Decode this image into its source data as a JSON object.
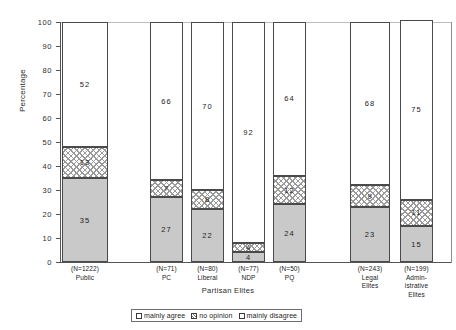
{
  "chart_data": {
    "type": "bar",
    "title": "",
    "xlabel": "Partisan Elites",
    "ylabel": "Percentage",
    "ylim": [
      0,
      100
    ],
    "yticks": [
      0,
      10,
      20,
      30,
      40,
      50,
      60,
      70,
      80,
      90,
      100
    ],
    "grid": false,
    "stacked": true,
    "legend_position": "bottom",
    "categories": [
      "Public",
      "PC",
      "Liberal",
      "NDP",
      "PQ",
      "Legal Elites",
      "Administrative Elites"
    ],
    "category_labels": [
      {
        "n": "(N=1222)",
        "name_line1": "Public",
        "name_line2": "",
        "name_line3": ""
      },
      {
        "n": "(N=71)",
        "name_line1": "PC",
        "name_line2": "",
        "name_line3": ""
      },
      {
        "n": "(N=80)",
        "name_line1": "Liberal",
        "name_line2": "",
        "name_line3": ""
      },
      {
        "n": "(N=77)",
        "name_line1": "NDP",
        "name_line2": "",
        "name_line3": ""
      },
      {
        "n": "(N=50)",
        "name_line1": "PQ",
        "name_line2": "",
        "name_line3": ""
      },
      {
        "n": "(N=243)",
        "name_line1": "Legal",
        "name_line2": "Elites",
        "name_line3": ""
      },
      {
        "n": "(N=199)",
        "name_line1": "Admin-",
        "name_line2": "istrative",
        "name_line3": "Elites"
      }
    ],
    "series": [
      {
        "name": "mainly agree",
        "values": [
          35,
          27,
          22,
          4,
          24,
          23,
          15
        ]
      },
      {
        "name": "no opinion",
        "values": [
          13,
          7,
          8,
          4,
          12,
          9,
          11
        ]
      },
      {
        "name": "mainly disagree",
        "values": [
          52,
          66,
          70,
          92,
          64,
          68,
          75
        ]
      }
    ]
  },
  "legend": {
    "items": [
      {
        "label": "mainly agree",
        "swatch": "agree"
      },
      {
        "label": "no opinion",
        "swatch": "noop"
      },
      {
        "label": "mainly disagree",
        "swatch": "disagree"
      }
    ]
  },
  "colors": {
    "agree_fill": "#c9c9c9",
    "noop_fill": "#ffffff",
    "disagree_fill": "#ffffff",
    "outline": "#4a4a4a",
    "axis": "#555555",
    "text": "#1c1c1c"
  }
}
